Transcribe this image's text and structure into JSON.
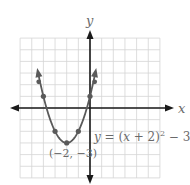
{
  "chart_data": {
    "type": "line",
    "title": "",
    "equation_label": "y = (x + 2)² − 3",
    "equation_parts": {
      "y": "y",
      "eq": " = (",
      "x": "x",
      "rest": " + 2)",
      "sup": "2",
      "tail": " − 3"
    },
    "vertex_label": "(−2, −3)",
    "xlabel": "x",
    "ylabel": "y",
    "xlim": [
      -6,
      6
    ],
    "ylim": [
      -6,
      6
    ],
    "grid": true,
    "tick_labels_shown": false,
    "series": [
      {
        "name": "y = (x + 2)^2 - 3",
        "function": "(x+2)^2-3",
        "domain": [
          -4.45,
          0.45
        ],
        "points": [
          {
            "x": -4,
            "y": 1
          },
          {
            "x": -3,
            "y": -2
          },
          {
            "x": -2,
            "y": -3
          },
          {
            "x": -1,
            "y": -2
          },
          {
            "x": 0,
            "y": 1
          }
        ],
        "color": "#5a5a5a"
      }
    ],
    "vertex": {
      "x": -2,
      "y": -3
    }
  },
  "colors": {
    "grid": "#d4d4d4",
    "axis": "#1a1a1a",
    "curve": "#5a5a5a",
    "label": "#6a6a6a"
  }
}
